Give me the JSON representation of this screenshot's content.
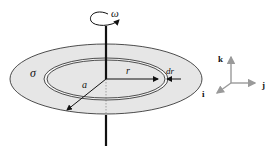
{
  "diagram": {
    "labels": {
      "omega": "ω",
      "sigma": "σ",
      "radius_r": "r",
      "radius_a": "a",
      "dr": "dr"
    },
    "axes": {
      "k": "k",
      "j": "j",
      "i": "i"
    },
    "colors": {
      "disk_fill": "#e6e6e6",
      "ring_fill": "#f4f4f4",
      "stroke": "#222222",
      "axes_gray": "#a0a0a0"
    }
  }
}
